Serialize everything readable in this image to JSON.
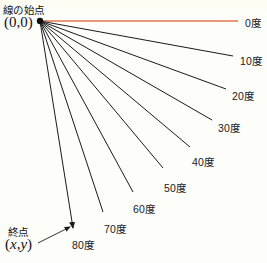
{
  "diagram": {
    "title_semantic": "angle-fan-diagram",
    "origin": {
      "x": 40,
      "y": 21
    },
    "background_color": "#fdfdfa",
    "ray_color": "#1a1a1a",
    "zero_degree_color": "#e0764a",
    "annotations": {
      "start_label": "線の始点",
      "start_coord": "(0,0)",
      "end_label": "終点",
      "end_coord_open": "(",
      "end_coord_x": "x",
      "end_coord_comma": ",",
      "end_coord_y": "y",
      "end_coord_close": ")"
    },
    "leader": {
      "name": "end-point-leader-arrow",
      "from_x": 38,
      "from_y": 243,
      "to_x": 70,
      "to_y": 227
    }
  },
  "chart_data": {
    "type": "line",
    "xlabel": "",
    "ylabel": "",
    "grid": false,
    "legend": "right",
    "origin": {
      "x": 0,
      "y": 0
    },
    "angle_unit": "度",
    "categories": [
      "0度",
      "10度",
      "20度",
      "30度",
      "40度",
      "50度",
      "60度",
      "70度",
      "80度"
    ],
    "values": [
      0,
      10,
      20,
      30,
      40,
      50,
      60,
      70,
      80
    ],
    "rays": [
      {
        "label": "0度",
        "angle": 0,
        "x1": 40,
        "y1": 21,
        "x2": 238,
        "y2": 21,
        "color": "#e0764a",
        "arrow": false,
        "label_x": 245,
        "label_y": 15
      },
      {
        "label": "10度",
        "angle": 10,
        "x1": 40,
        "y1": 21,
        "x2": 233,
        "y2": 56,
        "color": "#1a1a1a",
        "arrow": false,
        "label_x": 240,
        "label_y": 53
      },
      {
        "label": "20度",
        "angle": 20,
        "x1": 40,
        "y1": 21,
        "x2": 226,
        "y2": 89,
        "color": "#1a1a1a",
        "arrow": false,
        "label_x": 232,
        "label_y": 88
      },
      {
        "label": "30度",
        "angle": 30,
        "x1": 40,
        "y1": 21,
        "x2": 212,
        "y2": 120,
        "color": "#1a1a1a",
        "arrow": false,
        "label_x": 218,
        "label_y": 120
      },
      {
        "label": "40度",
        "angle": 40,
        "x1": 40,
        "y1": 21,
        "x2": 190,
        "y2": 147,
        "color": "#1a1a1a",
        "arrow": false,
        "label_x": 192,
        "label_y": 154
      },
      {
        "label": "50度",
        "angle": 50,
        "x1": 40,
        "y1": 21,
        "x2": 163,
        "y2": 168,
        "color": "#1a1a1a",
        "arrow": false,
        "label_x": 164,
        "label_y": 180
      },
      {
        "label": "60度",
        "angle": 60,
        "x1": 40,
        "y1": 21,
        "x2": 133,
        "y2": 192,
        "color": "#1a1a1a",
        "arrow": false,
        "label_x": 133,
        "label_y": 201
      },
      {
        "label": "70度",
        "angle": 70,
        "x1": 40,
        "y1": 21,
        "x2": 103,
        "y2": 212,
        "color": "#1a1a1a",
        "arrow": false,
        "label_x": 104,
        "label_y": 221
      },
      {
        "label": "80度",
        "angle": 80,
        "x1": 40,
        "y1": 21,
        "x2": 73,
        "y2": 228,
        "color": "#1a1a1a",
        "arrow": true,
        "label_x": 72,
        "label_y": 237
      }
    ]
  }
}
